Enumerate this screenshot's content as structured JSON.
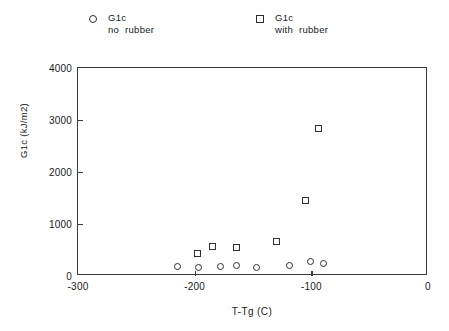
{
  "legend": {
    "entries": [
      {
        "marker": "circle-marker",
        "line1": "G1c",
        "line2": "no  rubber"
      },
      {
        "marker": "square-marker",
        "line1": "G1c",
        "line2": "with  rubber"
      }
    ]
  },
  "chart_data": {
    "type": "scatter",
    "title": "",
    "xlabel": "T-Tg (C)",
    "ylabel": "G1c  (kJ/m2)",
    "xlim": [
      -300,
      0
    ],
    "ylim": [
      0,
      4000
    ],
    "xticks": [
      -300,
      -200,
      -100,
      0
    ],
    "xticklabels": [
      "-300",
      "-200",
      "-100",
      "0"
    ],
    "yticks": [
      0,
      1000,
      2000,
      3000,
      4000
    ],
    "yticklabels": [
      "0",
      "1000",
      "2000",
      "3000",
      "4000"
    ],
    "grid": false,
    "legend_position": "above-plot",
    "series": [
      {
        "name": "G1c no rubber",
        "marker": "circle",
        "points": [
          {
            "x": -215,
            "y": 190
          },
          {
            "x": -197,
            "y": 170
          },
          {
            "x": -178,
            "y": 190
          },
          {
            "x": -164,
            "y": 210
          },
          {
            "x": -147,
            "y": 170
          },
          {
            "x": -119,
            "y": 210
          },
          {
            "x": -101,
            "y": 270
          },
          {
            "x": -90,
            "y": 250
          }
        ]
      },
      {
        "name": "G1c with rubber",
        "marker": "square",
        "points": [
          {
            "x": -198,
            "y": 440
          },
          {
            "x": -185,
            "y": 560
          },
          {
            "x": -164,
            "y": 540
          },
          {
            "x": -130,
            "y": 670
          },
          {
            "x": -105,
            "y": 1460
          },
          {
            "x": -94,
            "y": 2830
          }
        ]
      }
    ]
  }
}
